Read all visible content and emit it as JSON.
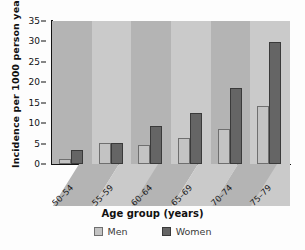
{
  "chart_data": {
    "type": "bar",
    "title": "",
    "xlabel": "Age group (years)",
    "ylabel": "Incidence per 1000 person years",
    "categories": [
      "50–54",
      "55–59",
      "60–64",
      "65–69",
      "70–74",
      "75–79"
    ],
    "series": [
      {
        "name": "Men",
        "color": "#c3c3c3",
        "values": [
          1.2,
          5.2,
          4.6,
          6.3,
          8.5,
          14.1
        ]
      },
      {
        "name": "Women",
        "color": "#656565",
        "values": [
          3.5,
          5.2,
          9.2,
          12.6,
          18.5,
          29.8
        ]
      }
    ],
    "ylim": [
      0,
      35
    ],
    "yticks": [
      0,
      5,
      10,
      15,
      20,
      25,
      30,
      35
    ],
    "grid": false,
    "legend_position": "bottom",
    "legend": [
      "Men",
      "Women"
    ]
  },
  "legend": {
    "men_label": "Men",
    "women_label": "Women"
  },
  "axis": {
    "x_title": "Age group (years)",
    "y_title": "Incidence per 1000 person years"
  }
}
